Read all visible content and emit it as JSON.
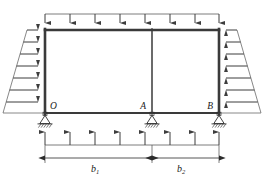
{
  "figure": {
    "kind": "structural-frame-diagram",
    "background_color": "#ffffff",
    "member_color": "#3a3a3a",
    "load_color": "#4a4a4a",
    "label_color": "#1a1a1a"
  },
  "nodes": [
    {
      "id": "O",
      "label": "O",
      "x": 45,
      "y": 113,
      "label_x": 50,
      "label_y": 109
    },
    {
      "id": "A",
      "label": "A",
      "x": 152,
      "y": 113,
      "label_x": 139,
      "label_y": 109
    },
    {
      "id": "B",
      "label": "B",
      "x": 219,
      "y": 113,
      "label_x": 206,
      "label_y": 109
    }
  ],
  "frame": {
    "top_beam": {
      "x1": 45,
      "y1": 30,
      "x2": 219,
      "y2": 30,
      "width": 2.6
    },
    "bottom_beam": {
      "x1": 45,
      "y1": 113,
      "x2": 219,
      "y2": 113,
      "width": 2.2
    },
    "columns": [
      {
        "id": "col-left",
        "x": 45,
        "y1": 30,
        "y2": 113,
        "width": 2.6
      },
      {
        "id": "col-middle",
        "x": 152,
        "y1": 30,
        "y2": 113,
        "width": 1.5
      },
      {
        "id": "col-right",
        "x": 219,
        "y1": 30,
        "y2": 113,
        "width": 2.6
      }
    ]
  },
  "supports": [
    {
      "id": "support-O",
      "type": "pin",
      "x": 45,
      "y": 113
    },
    {
      "id": "support-A",
      "type": "pin",
      "x": 152,
      "y": 113
    },
    {
      "id": "support-B",
      "type": "pin",
      "x": 219,
      "y": 113
    }
  ],
  "loads": {
    "top": {
      "name": "top-uniform-load",
      "direction": "down",
      "header_y": 14,
      "tip_y": 29,
      "x_from": 45,
      "x_to": 219,
      "arrow_x": [
        45,
        70,
        95,
        120,
        145,
        170,
        195,
        219
      ],
      "label": ""
    },
    "bottom": {
      "name": "bottom-uniform-load",
      "direction": "up",
      "base_y": 145,
      "tip_y": 120,
      "x_from": 45,
      "x_to": 219,
      "arrow_x": [
        45,
        70,
        95,
        120,
        145,
        170,
        195,
        219
      ],
      "label": ""
    },
    "left_side": {
      "name": "left-trapezoidal-load",
      "direction": "right",
      "at_x": 45,
      "y_top": 30,
      "y_bottom": 113,
      "width_top": 18,
      "width_bottom": 42,
      "arrow_y": [
        30,
        42,
        54,
        66,
        78,
        90,
        102,
        113
      ],
      "label": ""
    },
    "right_side": {
      "name": "right-trapezoidal-load",
      "direction": "left",
      "at_x": 219,
      "y_top": 30,
      "y_bottom": 113,
      "width_top": 18,
      "width_bottom": 42,
      "arrow_y": [
        30,
        42,
        54,
        66,
        78,
        90,
        102,
        113
      ],
      "label": ""
    }
  },
  "dimensions": {
    "line_y": 158,
    "extension_top_y": 140,
    "items": [
      {
        "id": "dim-b1",
        "base": "b",
        "subscript": "1",
        "text": "b1",
        "x_from": 45,
        "x_to": 152,
        "label_x": 95,
        "label_y": 170
      },
      {
        "id": "dim-b2",
        "base": "b",
        "subscript": "2",
        "text": "b2",
        "x_from": 152,
        "x_to": 219,
        "label_x": 180,
        "label_y": 170
      }
    ]
  }
}
